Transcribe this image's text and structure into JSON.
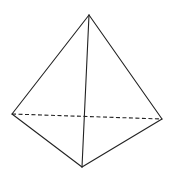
{
  "diagram": {
    "type": "tetrahedron",
    "background": "#ffffff",
    "stroke_color": "#222222",
    "stroke_width": 1.1,
    "dash_pattern": "4 2.5",
    "vertices": {
      "apex": [
        89,
        15
      ],
      "left": [
        12,
        114
      ],
      "right": [
        162,
        119
      ],
      "front": [
        82,
        167
      ]
    },
    "edges": [
      {
        "from": "apex",
        "to": "left",
        "style": "solid"
      },
      {
        "from": "apex",
        "to": "right",
        "style": "solid"
      },
      {
        "from": "apex",
        "to": "front",
        "style": "solid"
      },
      {
        "from": "left",
        "to": "front",
        "style": "solid"
      },
      {
        "from": "right",
        "to": "front",
        "style": "solid"
      },
      {
        "from": "left",
        "to": "right",
        "style": "dashed"
      }
    ]
  }
}
